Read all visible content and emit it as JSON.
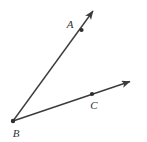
{
  "figure": {
    "kind": "geometry-angle-diagram",
    "background_color": "#ffffff",
    "stroke_color": "#3b3b3b",
    "label_color": "#333333",
    "stroke_width": 1.4,
    "width": 147,
    "height": 142,
    "points": [
      {
        "name": "A",
        "label": "A",
        "dot_x": 81.5,
        "dot_y": 30,
        "label_x": 70,
        "label_y": 24
      },
      {
        "name": "B",
        "label": "B",
        "dot_x": 13,
        "dot_y": 121,
        "label_x": 16,
        "label_y": 133
      },
      {
        "name": "C",
        "label": "C",
        "dot_x": 92,
        "dot_y": 94,
        "label_x": 94,
        "label_y": 105
      }
    ],
    "rays": [
      {
        "name": "ray-BA",
        "from": "B",
        "through": "A",
        "start_x": 13,
        "start_y": 121,
        "end_x": 96,
        "end_y": 8,
        "arrow": "end"
      },
      {
        "name": "ray-BC",
        "from": "B",
        "through": "C",
        "start_x": 13,
        "start_y": 121,
        "end_x": 134,
        "end_y": 80,
        "arrow": "end"
      }
    ]
  }
}
